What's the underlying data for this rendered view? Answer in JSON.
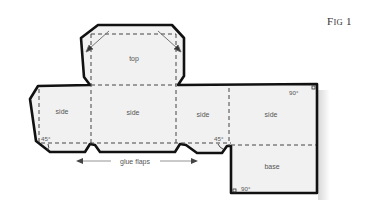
{
  "figure": {
    "label_prefix": "F",
    "label_smallcaps": "IG",
    "label_number": "1"
  },
  "panels": {
    "top": "top",
    "side_1": "side",
    "side_2": "side",
    "side_3": "side",
    "side_4": "side",
    "base": "base"
  },
  "annotations": {
    "angle_left": "45°",
    "angle_mid": "45°",
    "angle_top_right": "90°",
    "angle_bottom": "90°",
    "glue_flaps": "glue flaps"
  },
  "colors": {
    "outline": "#111111",
    "fold_line": "#444444",
    "paper": "#f1f1f1",
    "text": "#555555",
    "arrow": "#555555"
  }
}
